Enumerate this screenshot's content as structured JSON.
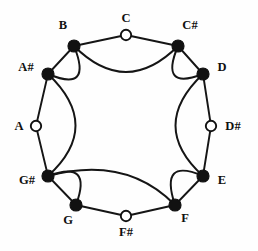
{
  "figure": {
    "width": 258,
    "height": 251,
    "background_color": "#fefefe",
    "ink_color": "#111111"
  },
  "chart_data": {
    "type": "diagram",
    "subtype": "node-link-circle",
    "title": "",
    "xlabel": "",
    "ylabel": "",
    "legend": [],
    "grid": false,
    "center": [
      126,
      126
    ],
    "radius": 92,
    "node_count": 12,
    "nodes": [
      {
        "id": "C",
        "label": "C",
        "style": "open",
        "x": 126,
        "y": 35,
        "r": 5.2,
        "label_x": 126,
        "label_y": 22,
        "anchor": "middle"
      },
      {
        "id": "C#",
        "label": "C#",
        "style": "filled",
        "x": 178,
        "y": 46,
        "r": 6.0,
        "label_x": 190,
        "label_y": 29,
        "anchor": "middle"
      },
      {
        "id": "D",
        "label": "D",
        "style": "filled",
        "x": 203,
        "y": 74,
        "r": 6.0,
        "label_x": 222,
        "label_y": 71,
        "anchor": "middle"
      },
      {
        "id": "D#",
        "label": "D#",
        "style": "open",
        "x": 211,
        "y": 126,
        "r": 5.2,
        "label_x": 233,
        "label_y": 130,
        "anchor": "middle"
      },
      {
        "id": "E",
        "label": "E",
        "style": "filled",
        "x": 203,
        "y": 176,
        "r": 6.0,
        "label_x": 222,
        "label_y": 184,
        "anchor": "middle"
      },
      {
        "id": "F",
        "label": "F",
        "style": "filled",
        "x": 175,
        "y": 205,
        "r": 6.0,
        "label_x": 185,
        "label_y": 222,
        "anchor": "middle"
      },
      {
        "id": "F#",
        "label": "F#",
        "style": "open",
        "x": 126,
        "y": 216,
        "r": 5.2,
        "label_x": 126,
        "label_y": 236,
        "anchor": "middle"
      },
      {
        "id": "G",
        "label": "G",
        "style": "filled",
        "x": 76,
        "y": 205,
        "r": 6.0,
        "label_x": 68,
        "label_y": 224,
        "anchor": "middle"
      },
      {
        "id": "G#",
        "label": "G#",
        "style": "filled",
        "x": 48,
        "y": 176,
        "r": 6.0,
        "label_x": 27,
        "label_y": 184,
        "anchor": "middle"
      },
      {
        "id": "A",
        "label": "A",
        "style": "open",
        "x": 36,
        "y": 126,
        "r": 5.2,
        "label_x": 19,
        "label_y": 130,
        "anchor": "middle"
      },
      {
        "id": "A#",
        "label": "A#",
        "style": "filled",
        "x": 48,
        "y": 74,
        "r": 6.0,
        "label_x": 26,
        "label_y": 71,
        "anchor": "middle"
      },
      {
        "id": "B",
        "label": "B",
        "style": "filled",
        "x": 74,
        "y": 46,
        "r": 6.0,
        "label_x": 63,
        "label_y": 29,
        "anchor": "middle"
      }
    ],
    "straight_edges": [
      {
        "from": "B",
        "to": "C"
      },
      {
        "from": "C",
        "to": "C#"
      },
      {
        "from": "C#",
        "to": "D"
      },
      {
        "from": "D",
        "to": "D#"
      },
      {
        "from": "D#",
        "to": "E"
      },
      {
        "from": "E",
        "to": "F"
      },
      {
        "from": "F",
        "to": "F#"
      },
      {
        "from": "F#",
        "to": "G"
      },
      {
        "from": "G",
        "to": "G#"
      },
      {
        "from": "G#",
        "to": "A"
      },
      {
        "from": "A",
        "to": "A#"
      },
      {
        "from": "A#",
        "to": "B"
      }
    ],
    "arc_edges": [
      {
        "from": "B",
        "to": "C#",
        "path": "M 74 46 Q 126 98 178 46"
      },
      {
        "from": "A#",
        "to": "B",
        "path": "M 48 74 Q 93 93 74 46"
      },
      {
        "from": "C#",
        "to": "D",
        "path": "M 178 46 Q 159 91 203 74"
      },
      {
        "from": "A#",
        "to": "G#",
        "path": "M 48 74 Q 103 126 48 176"
      },
      {
        "from": "D",
        "to": "E",
        "path": "M 203 74 Q 148 126 203 176"
      },
      {
        "from": "G#",
        "to": "G",
        "path": "M 48 176 Q 93 159 76 205"
      },
      {
        "from": "E",
        "to": "F",
        "path": "M 203 176 Q 159 157 175 205"
      },
      {
        "from": "G#",
        "to": "F",
        "path": "M 48 176 Q 126 155 175 205"
      }
    ]
  }
}
